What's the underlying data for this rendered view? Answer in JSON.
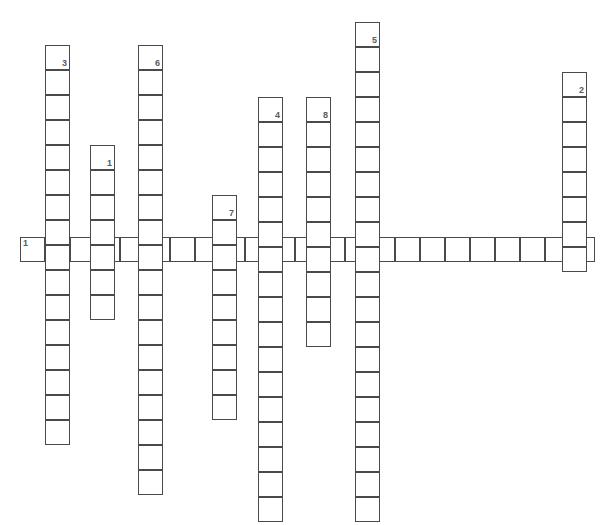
{
  "puzzle": {
    "title": "Crossword Grid",
    "cell_size": 25,
    "border_color": "#4a4a4a",
    "cell_fill": "#ffffff",
    "background": "#ffffff",
    "number_color": "#5a5a5a",
    "canvas_width": 606,
    "canvas_height": 525,
    "entries": [
      {
        "number": "1",
        "direction": "across",
        "label": "1 Across",
        "length": 23,
        "start_x": 20,
        "start_y": 237,
        "number_position": "left"
      },
      {
        "number": "3",
        "direction": "down",
        "label": "3 Down",
        "length": 16,
        "start_x": 45,
        "start_y": 45,
        "number_position": "right"
      },
      {
        "number": "1",
        "direction": "down",
        "label": "1 Down",
        "length": 7,
        "start_x": 90,
        "start_y": 145,
        "number_position": "right"
      },
      {
        "number": "6",
        "direction": "down",
        "label": "6 Down",
        "length": 18,
        "start_x": 138,
        "start_y": 45,
        "number_position": "right"
      },
      {
        "number": "7",
        "direction": "down",
        "label": "7 Down",
        "length": 9,
        "start_x": 212,
        "start_y": 195,
        "number_position": "right"
      },
      {
        "number": "4",
        "direction": "down",
        "label": "4 Down",
        "length": 17,
        "start_x": 258,
        "start_y": 97,
        "number_position": "right"
      },
      {
        "number": "8",
        "direction": "down",
        "label": "8 Down",
        "length": 10,
        "start_x": 306,
        "start_y": 97,
        "number_position": "right"
      },
      {
        "number": "5",
        "direction": "down",
        "label": "5 Down",
        "length": 20,
        "start_x": 355,
        "start_y": 22,
        "number_position": "right"
      },
      {
        "number": "2",
        "direction": "down",
        "label": "2 Down",
        "length": 8,
        "start_x": 562,
        "start_y": 72,
        "number_position": "right"
      }
    ]
  }
}
